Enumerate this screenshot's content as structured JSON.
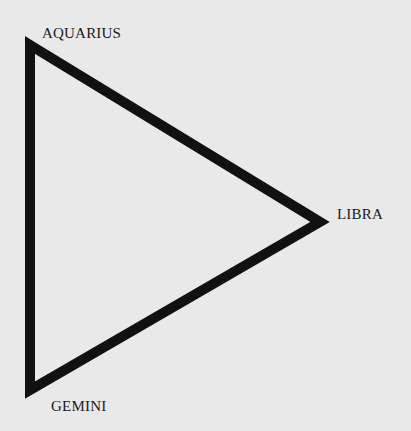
{
  "diagram": {
    "type": "triangle",
    "vertices": [
      {
        "label": "AQUARIUS",
        "position": "top-left"
      },
      {
        "label": "LIBRA",
        "position": "right"
      },
      {
        "label": "GEMINI",
        "position": "bottom-left"
      }
    ],
    "stroke_color": "#111111",
    "background_color": "#e9e9e9"
  }
}
